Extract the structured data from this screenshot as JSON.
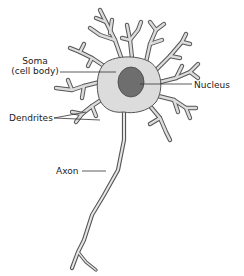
{
  "labels": {
    "soma_line1": "Soma",
    "soma_line2": "(cell body)",
    "nucleus": "Nucleus",
    "dendrites": "Dendrites",
    "axon": "Axon"
  },
  "colors": {
    "cell_fill": "#dcdcdc",
    "cell_outline": "#555555",
    "nucleus_fill": "#6e6e6e",
    "leader_line": "#333333",
    "text": "#222222"
  }
}
